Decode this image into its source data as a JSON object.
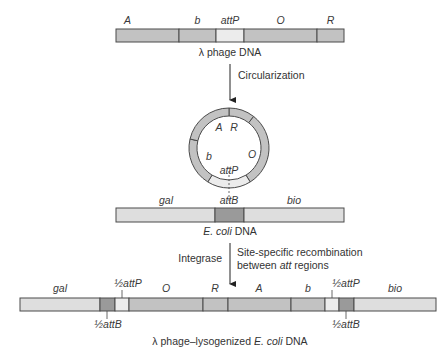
{
  "colors": {
    "gene": "#c2c2c2",
    "att_light": "#ececec",
    "att_dark": "#9a9a9a",
    "host": "#dedede",
    "stroke": "#4a4a4a",
    "text": "#333333"
  },
  "phage": {
    "caption": "λ phage DNA",
    "segments": [
      {
        "label": "A",
        "x0": 116,
        "x1": 179,
        "fill": "gene",
        "italic": true
      },
      {
        "label": "b",
        "x0": 179,
        "x1": 216,
        "fill": "gene",
        "italic": true
      },
      {
        "label": "attP",
        "x0": 216,
        "x1": 244,
        "fill": "att_light",
        "italic": true
      },
      {
        "label": "O",
        "x0": 244,
        "x1": 317,
        "fill": "gene",
        "italic": true
      },
      {
        "label": "R",
        "x0": 317,
        "x1": 344,
        "fill": "gene",
        "italic": true
      }
    ]
  },
  "step1": {
    "label": "Circularization"
  },
  "circle": {
    "cx": 229,
    "cy": 148,
    "r_out": 40,
    "r_in": 32,
    "segments": [
      {
        "label": "R",
        "a0": 0,
        "a1": 38,
        "fill": "gene"
      },
      {
        "label": "O",
        "a0": 38,
        "a1": 148,
        "fill": "gene"
      },
      {
        "label": "attP",
        "a0": 148,
        "a1": 212,
        "fill": "att_light"
      },
      {
        "label": "b",
        "a0": 212,
        "a1": 283,
        "fill": "gene"
      },
      {
        "label": "A",
        "a0": 283,
        "a1": 360,
        "fill": "gene"
      }
    ],
    "labels": [
      {
        "text": "A",
        "x": 219,
        "y": 131
      },
      {
        "text": "R",
        "x": 234,
        "y": 131
      },
      {
        "text": "O",
        "x": 252,
        "y": 158
      },
      {
        "text": "b",
        "x": 209,
        "y": 160
      },
      {
        "text": "attP",
        "x": 229,
        "y": 174
      }
    ]
  },
  "ecoli": {
    "caption_italic": "E. coli",
    "caption_rest": " DNA",
    "segments": [
      {
        "label": "gal",
        "x0": 116,
        "x1": 215,
        "fill": "host"
      },
      {
        "label": "attB",
        "x0": 215,
        "x1": 244,
        "fill": "att_dark"
      },
      {
        "label": "bio",
        "x0": 244,
        "x1": 344,
        "fill": "host"
      }
    ],
    "label_pos": [
      {
        "text": "gal",
        "x": 166
      },
      {
        "text": "attB",
        "x": 229
      },
      {
        "text": "bio",
        "x": 294
      }
    ]
  },
  "step2": {
    "left_label": "Integrase",
    "right_line1": "Site-specific recombination",
    "right_line2_pre": "between ",
    "right_line2_it": "att",
    "right_line2_post": " regions"
  },
  "lysogen": {
    "caption_pre": "λ phage–lysogenized ",
    "caption_italic": "E. coli",
    "caption_post": " DNA",
    "segments": [
      {
        "label": "gal",
        "x0": 20,
        "x1": 100,
        "fill": "host"
      },
      {
        "label": "½attB",
        "x0": 100,
        "x1": 115,
        "fill": "att_dark"
      },
      {
        "label": "½attP",
        "x0": 115,
        "x1": 129,
        "fill": "att_light"
      },
      {
        "label": "O",
        "x0": 129,
        "x1": 203,
        "fill": "gene"
      },
      {
        "label": "R",
        "x0": 203,
        "x1": 228,
        "fill": "gene"
      },
      {
        "label": "A",
        "x0": 228,
        "x1": 291,
        "fill": "gene"
      },
      {
        "label": "b",
        "x0": 291,
        "x1": 325,
        "fill": "gene"
      },
      {
        "label": "½attP",
        "x0": 325,
        "x1": 339,
        "fill": "att_light"
      },
      {
        "label": "½attB",
        "x0": 339,
        "x1": 354,
        "fill": "att_dark"
      },
      {
        "label": "bio",
        "x0": 354,
        "x1": 436,
        "fill": "host"
      }
    ],
    "top_labels": [
      {
        "text": "gal",
        "x": 60
      },
      {
        "text": "½attP",
        "x": 128,
        "tick": 122
      },
      {
        "text": "O",
        "x": 166
      },
      {
        "text": "R",
        "x": 215
      },
      {
        "text": "A",
        "x": 259
      },
      {
        "text": "b",
        "x": 308
      },
      {
        "text": "½attP",
        "x": 346,
        "tick": 332
      },
      {
        "text": "bio",
        "x": 395
      }
    ],
    "bottom_labels": [
      {
        "text": "½attB",
        "x": 108,
        "tick": 107
      },
      {
        "text": "½attB",
        "x": 346,
        "tick": 346
      }
    ]
  }
}
